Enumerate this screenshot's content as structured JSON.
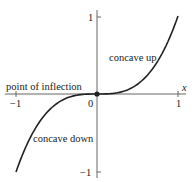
{
  "chart_data": {
    "type": "line",
    "title": "",
    "function": "y = x^3",
    "xlabel": "x",
    "ylabel": "",
    "xlim": [
      -1,
      1
    ],
    "ylim": [
      -1,
      1
    ],
    "grid": false,
    "x_ticks": [
      "-1",
      "0",
      "1"
    ],
    "y_ticks": [
      "1",
      "-1"
    ],
    "series": [
      {
        "name": "y = x^3",
        "x": [
          -1,
          -0.9,
          -0.8,
          -0.7,
          -0.6,
          -0.5,
          -0.4,
          -0.3,
          -0.2,
          -0.1,
          0,
          0.1,
          0.2,
          0.3,
          0.4,
          0.5,
          0.6,
          0.7,
          0.8,
          0.9,
          1
        ],
        "y": [
          -1,
          -0.729,
          -0.512,
          -0.343,
          -0.216,
          -0.125,
          -0.064,
          -0.027,
          -0.008,
          -0.001,
          0,
          0.001,
          0.008,
          0.027,
          0.064,
          0.125,
          0.216,
          0.343,
          0.512,
          0.729,
          1
        ]
      }
    ],
    "annotations": [
      {
        "text": "concave up",
        "near": [
          0.5,
          0.45
        ]
      },
      {
        "text": "point of inflection",
        "near": [
          0,
          0
        ],
        "marker": true
      },
      {
        "text": "concave down",
        "near": [
          -0.5,
          -0.45
        ]
      }
    ]
  },
  "labels": {
    "x_axis": "x",
    "tick_x_neg1": "−1",
    "tick_x_0": "0",
    "tick_x_1": "1",
    "tick_y_1": "1",
    "tick_y_neg1": "−1",
    "concave_up": "concave up",
    "point_of_inflection": "point of inflection",
    "concave_down": "concave down"
  },
  "colors": {
    "curve": "#222222",
    "axis": "#555555"
  }
}
